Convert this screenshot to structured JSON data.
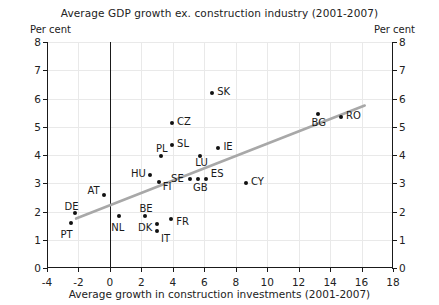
{
  "chart_data": {
    "type": "scatter",
    "title": "Average GDP growth ex. construction industry (2001-2007)",
    "xlabel": "Average growth in construction investments (2001-2007)",
    "ylabel": "Per cent",
    "unit_label_left": "Per cent",
    "unit_label_right": "Per cent",
    "xlim": [
      -4,
      18
    ],
    "ylim": [
      0,
      8
    ],
    "xticks": [
      -4,
      -2,
      0,
      2,
      4,
      6,
      8,
      10,
      12,
      14,
      16,
      18
    ],
    "yticks": [
      0,
      1,
      2,
      3,
      4,
      5,
      6,
      7,
      8
    ],
    "grid": true,
    "legend": "none",
    "points": [
      {
        "label": "PT",
        "x": -2.5,
        "y": 1.6,
        "lx": -10,
        "ly": 12
      },
      {
        "label": "DE",
        "x": -2.25,
        "y": 1.95,
        "lx": -10,
        "ly": -6
      },
      {
        "label": "AT",
        "x": -0.35,
        "y": 2.6,
        "lx": -17,
        "ly": -4
      },
      {
        "label": "NL",
        "x": 0.6,
        "y": 1.85,
        "lx": -8,
        "ly": 12
      },
      {
        "label": "BE",
        "x": 2.2,
        "y": 1.85,
        "lx": -5,
        "ly": -7
      },
      {
        "label": "DK",
        "x": 3.0,
        "y": 1.55,
        "lx": -19,
        "ly": 4
      },
      {
        "label": "IT",
        "x": 3.0,
        "y": 1.3,
        "lx": 4,
        "ly": 8
      },
      {
        "label": "FR",
        "x": 3.9,
        "y": 1.75,
        "lx": 5,
        "ly": 3
      },
      {
        "label": "HU",
        "x": 2.55,
        "y": 3.3,
        "lx": -19,
        "ly": -1
      },
      {
        "label": "FI",
        "x": 3.1,
        "y": 3.05,
        "lx": 4,
        "ly": 5
      },
      {
        "label": "PL",
        "x": 3.25,
        "y": 3.95,
        "lx": -5,
        "ly": -7
      },
      {
        "label": "SL",
        "x": 3.95,
        "y": 4.35,
        "lx": 5,
        "ly": -1
      },
      {
        "label": "CZ",
        "x": 3.95,
        "y": 5.15,
        "lx": 5,
        "ly": -1
      },
      {
        "label": "SE",
        "x": 5.1,
        "y": 3.15,
        "lx": -19,
        "ly": 0
      },
      {
        "label": "GB",
        "x": 5.6,
        "y": 3.15,
        "lx": -5,
        "ly": 9
      },
      {
        "label": "ES",
        "x": 6.1,
        "y": 3.15,
        "lx": 5,
        "ly": -5
      },
      {
        "label": "LU",
        "x": 5.75,
        "y": 3.95,
        "lx": -5,
        "ly": 7
      },
      {
        "label": "IE",
        "x": 6.9,
        "y": 4.25,
        "lx": 5,
        "ly": -1
      },
      {
        "label": "SK",
        "x": 6.5,
        "y": 6.2,
        "lx": 5,
        "ly": -1
      },
      {
        "label": "CY",
        "x": 8.65,
        "y": 3.0,
        "lx": 5,
        "ly": -1
      },
      {
        "label": "BG",
        "x": 13.2,
        "y": 5.45,
        "lx": -6,
        "ly": 9
      },
      {
        "label": "RO",
        "x": 14.7,
        "y": 5.35,
        "lx": 5,
        "ly": -1
      }
    ],
    "trendline": {
      "x1": -2.15,
      "y1": 1.75,
      "x2": 16.2,
      "y2": 5.75,
      "color": "#a8a8a8"
    }
  }
}
